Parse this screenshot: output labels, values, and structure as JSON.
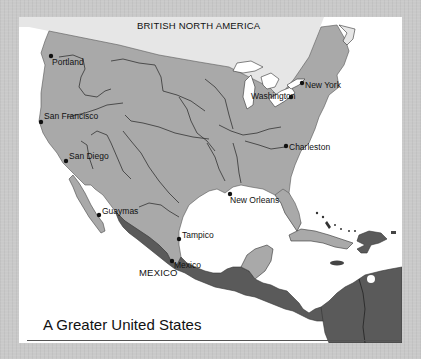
{
  "map": {
    "title": "A Greater United States",
    "colors": {
      "background": "#c9c9c9",
      "card": "#ffffff",
      "united_states": "#a9a9a9",
      "british_north_america": "#e6e6e6",
      "mexico_central_america": "#5a5a5a",
      "water": "#ffffff",
      "borders": "#2a2a2a"
    },
    "regions": [
      {
        "name": "BRITISH NORTH AMERICA",
        "shade": "light"
      },
      {
        "name": "MEXICO",
        "shade": "dark"
      }
    ],
    "cities": [
      {
        "name": "Portland"
      },
      {
        "name": "San Francisco"
      },
      {
        "name": "San Diego"
      },
      {
        "name": "Guaymas"
      },
      {
        "name": "Washington"
      },
      {
        "name": "New York"
      },
      {
        "name": "Charleston"
      },
      {
        "name": "New Orleans"
      },
      {
        "name": "Tampico"
      },
      {
        "name": "Mexico"
      }
    ]
  }
}
